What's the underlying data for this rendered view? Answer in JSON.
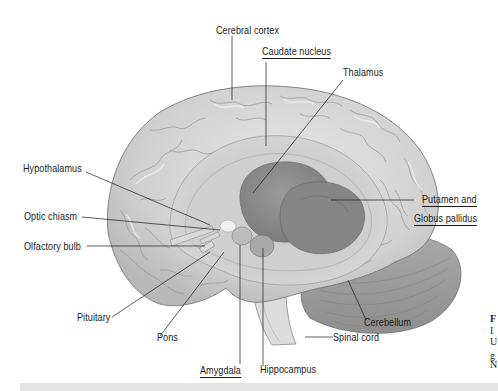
{
  "figure": {
    "labels": {
      "cerebral_cortex": "Cerebral cortex",
      "caudate_nucleus": "Caudate nucleus",
      "thalamus": "Thalamus",
      "hypothalamus": "Hypothalamus",
      "optic_chiasm": "Optic chiasm",
      "olfactory_bulb": "Olfactory bulb",
      "putamen_line1": "Putamen and",
      "putamen_line2": "Globus pallidus",
      "pituitary": "Pituitary",
      "pons": "Pons",
      "amygdala": "Amygdala",
      "hippocampus": "Hippocampus",
      "cerebellum": "Cerebellum",
      "spinal_cord": "Spinal cord"
    },
    "underlined_labels": [
      "Caudate nucleus",
      "Putamen and Globus pallidus",
      "Amygdala"
    ],
    "side_caption_fragments": [
      "F",
      "I",
      "U",
      "g",
      "N"
    ]
  },
  "colors": {
    "background": "#ffffff",
    "cortex": "#d6d6d6",
    "gyri_highlight": "#ececec",
    "basal_ganglia": "#8a8a8a",
    "leader_lines": "#1a1a1a",
    "footer_bar": "#e4e4e4"
  }
}
